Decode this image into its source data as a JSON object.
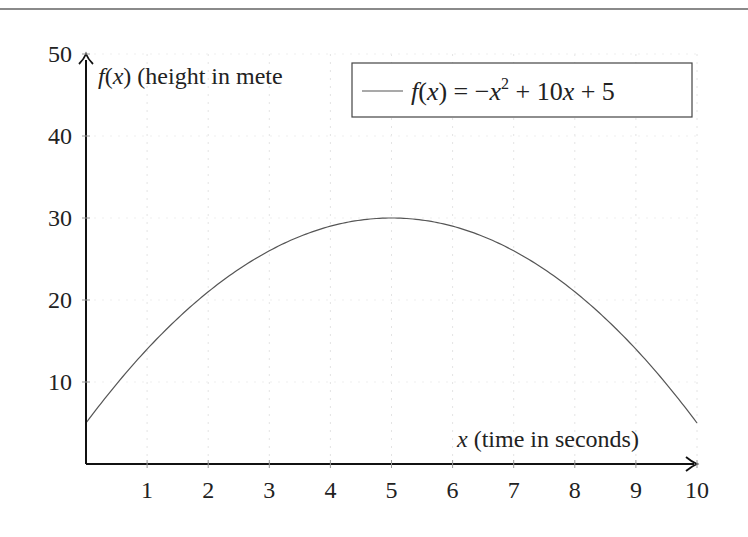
{
  "chart_data": {
    "type": "line",
    "title": "",
    "xlabel": "x (time in seconds)",
    "ylabel": "f(x) (height in meters)",
    "ylabel_visible": "f(x) (height in mete",
    "xlim": [
      0,
      10
    ],
    "ylim": [
      0,
      50
    ],
    "x_ticks": [
      1,
      2,
      3,
      4,
      5,
      6,
      7,
      8,
      9,
      10
    ],
    "y_ticks": [
      10,
      20,
      30,
      40,
      50
    ],
    "grid": "faint dotted vertical and horizontal",
    "legend_position": "top-right (boxed)",
    "series": [
      {
        "name": "f(x) = -x^2 + 10x + 5",
        "x": [
          0,
          1,
          2,
          3,
          4,
          5,
          6,
          7,
          8,
          9,
          10
        ],
        "values": [
          5,
          14,
          21,
          26,
          29,
          30,
          29,
          26,
          21,
          14,
          5
        ],
        "color": "#555555"
      }
    ]
  },
  "axes": {
    "x_label_var": "x",
    "x_label_rest": " (time in seconds)",
    "y_label_func": "f",
    "y_label_paren_open": "(",
    "y_label_var": "x",
    "y_label_paren_close": ")",
    "y_label_rest": " (height in mete",
    "x_tick_labels": [
      "1",
      "2",
      "3",
      "4",
      "5",
      "6",
      "7",
      "8",
      "9",
      "10"
    ],
    "y_tick_labels": [
      "10",
      "20",
      "30",
      "40",
      "50"
    ]
  },
  "legend": {
    "entry_label_parts": {
      "f": "f",
      "open": "(",
      "x": "x",
      "close_eq": ") = −",
      "x2": "x",
      "exp": "2",
      "plus10": " + 10",
      "x3": "x",
      "plus5": " + 5"
    }
  }
}
